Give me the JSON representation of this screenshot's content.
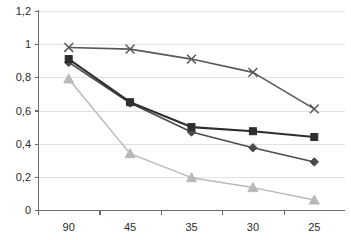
{
  "chart_data": {
    "type": "line",
    "title": "",
    "subtitle": "",
    "xlabel": "",
    "ylabel": "",
    "categories": [
      "90",
      "45",
      "35",
      "30",
      "25"
    ],
    "ylim": [
      0,
      1.2
    ],
    "y_ticks": [
      "0",
      "0,2",
      "0,4",
      "0,6",
      "0,8",
      "1",
      "1,2"
    ],
    "y_tick_values": [
      0,
      0.2,
      0.4,
      0.6,
      0.8,
      1.0,
      1.2
    ],
    "grid": "horizontal",
    "legend": "none",
    "decimal_separator": ",",
    "series": [
      {
        "name": "series-cross",
        "marker": "cross",
        "color": "#585858",
        "values": [
          0.98,
          0.97,
          0.91,
          0.83,
          0.61
        ]
      },
      {
        "name": "series-square",
        "marker": "square",
        "color": "#2e2e2e",
        "values": [
          0.91,
          0.65,
          0.5,
          0.475,
          0.44
        ]
      },
      {
        "name": "series-diamond",
        "marker": "diamond",
        "color": "#4a4a4a",
        "values": [
          0.89,
          0.645,
          0.47,
          0.375,
          0.29
        ]
      },
      {
        "name": "series-triangle",
        "marker": "triangle",
        "color": "#b9b9b9",
        "values": [
          0.79,
          0.34,
          0.195,
          0.135,
          0.06
        ]
      }
    ]
  },
  "colors": {
    "background": "#ffffff",
    "gridline": "#e2e2e2",
    "axis": "#6b6b6b",
    "tick_text": "#2b2b2b"
  }
}
